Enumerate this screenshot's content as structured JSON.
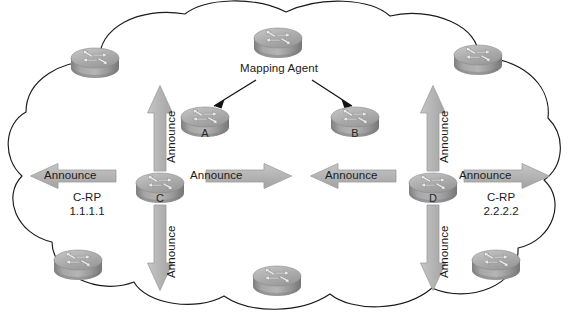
{
  "figure": {
    "background_color": "#ffffff",
    "cloud_outline_color": "#1a1a1a",
    "arrow_fill_color": "#b3b3b3",
    "arrow_edge_color": "#9a9a9a",
    "router_body_color": "#9d9d9d",
    "router_top_color": "#b8b8b8",
    "text_color": "#1b1b1b"
  },
  "labels": {
    "mapping_agent": "Mapping Agent"
  },
  "routers": [
    {
      "id": "top-left",
      "label": "",
      "x": 95,
      "y": 63,
      "has_label": false
    },
    {
      "id": "top-center",
      "label": "",
      "x": 278,
      "y": 43,
      "has_label": false
    },
    {
      "id": "top-right",
      "label": "",
      "x": 478,
      "y": 60,
      "has_label": false
    },
    {
      "id": "a",
      "label": "A",
      "x": 205,
      "y": 122,
      "has_label": true
    },
    {
      "id": "b",
      "label": "B",
      "x": 355,
      "y": 122,
      "has_label": true
    },
    {
      "id": "c",
      "label": "C",
      "x": 160,
      "y": 188,
      "has_label": true
    },
    {
      "id": "d",
      "label": "D",
      "x": 433,
      "y": 188,
      "has_label": true
    },
    {
      "id": "bottom-left",
      "label": "",
      "x": 78,
      "y": 265,
      "has_label": false
    },
    {
      "id": "bottom-center",
      "label": "",
      "x": 277,
      "y": 281,
      "has_label": false
    },
    {
      "id": "bottom-right",
      "label": "",
      "x": 496,
      "y": 265,
      "has_label": false
    }
  ],
  "announce_arrows": [
    {
      "id": "c-up",
      "label": "Announce",
      "orientation": "vertical",
      "direction": "up"
    },
    {
      "id": "c-down",
      "label": "Announce",
      "orientation": "vertical",
      "direction": "down"
    },
    {
      "id": "c-left",
      "label": "Announce",
      "orientation": "horizontal",
      "direction": "left"
    },
    {
      "id": "c-right",
      "label": "Announce",
      "orientation": "horizontal",
      "direction": "right"
    },
    {
      "id": "d-up",
      "label": "Announce",
      "orientation": "vertical",
      "direction": "up"
    },
    {
      "id": "d-down",
      "label": "Announce",
      "orientation": "vertical",
      "direction": "down"
    },
    {
      "id": "d-left",
      "label": "Announce",
      "orientation": "horizontal",
      "direction": "left"
    },
    {
      "id": "d-right",
      "label": "Announce",
      "orientation": "horizontal",
      "direction": "right"
    }
  ],
  "announce_text": {
    "c_up": "Announce",
    "c_down": "Announce",
    "c_left": "Announce",
    "c_right": "Announce",
    "d_up": "Announce",
    "d_down": "Announce",
    "d_left": "Announce",
    "d_right": "Announce"
  },
  "rp_annotations": {
    "c": {
      "role": "C-RP",
      "address": "1.1.1.1"
    },
    "d": {
      "role": "C-RP",
      "address": "2.2.2.2"
    }
  }
}
